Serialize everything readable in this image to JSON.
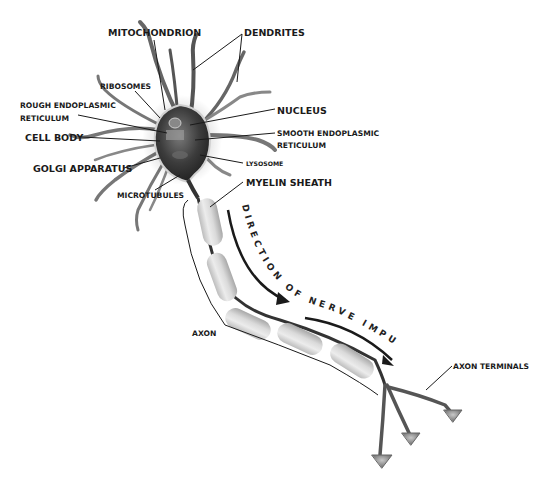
{
  "labels": {
    "mitochondrion": "MITOCHONDRION",
    "dendrites": "DENDRITES",
    "ribosomes": "RIBOSOMES",
    "rough_er_line1": "ROUGH ENDOPLASMIC",
    "rough_er_line2": "RETICULUM",
    "cell_body": "CELL BODY",
    "golgi": "GOLGI APPARATUS",
    "microtubules": "MICROTUBULES",
    "nucleus": "NUCLEUS",
    "smooth_er_line1": "SMOOTH ENDOPLASMIC",
    "smooth_er_line2": "RETICULUM",
    "lysosome": "LYSOSOME",
    "myelin": "MYELIN SHEATH",
    "axon": "AXON",
    "axon_terminals": "AXON TERMINALS"
  },
  "direction_text": "DIRECTION OF NERVE IMPULSE",
  "colors": {
    "background": "#ffffff",
    "text": "#1a1a1a",
    "dendrite": "#5a5a5a",
    "myelin": "#d8d8d8",
    "cell_interior": "#3a3a3a"
  }
}
